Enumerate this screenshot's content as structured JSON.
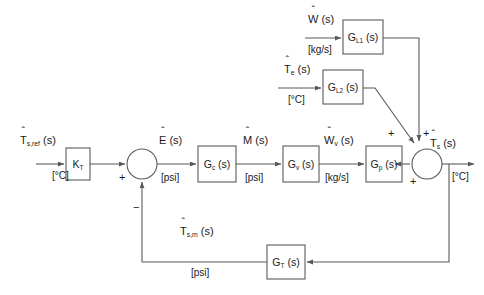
{
  "diagram": {
    "type": "block-diagram",
    "stroke_color": "#595959",
    "text_color": "#1a1a1a"
  },
  "signals": {
    "reference": {
      "name": "T",
      "sub": "s,ref",
      "arg": "(s)",
      "unit": "[°C]"
    },
    "error": {
      "name": "E",
      "sub": "",
      "arg": "(s)",
      "unit": "[psi]"
    },
    "controller_out": {
      "name": "M",
      "sub": "",
      "arg": "(s)",
      "unit": "[psi]"
    },
    "valve_out": {
      "name": "W",
      "sub": "v",
      "arg": "(s)",
      "unit": "[kg/s]"
    },
    "output": {
      "name": "T",
      "sub": "s",
      "arg": "(s)",
      "unit": "[°C]"
    },
    "measured": {
      "name": "T",
      "sub": "s,m",
      "arg": "(s)",
      "unit": "[psi]"
    },
    "disturbance_flow": {
      "name": "W",
      "sub": "",
      "arg": "(s)",
      "unit": "[kg/s]"
    },
    "disturbance_temp": {
      "name": "T",
      "sub": "e",
      "arg": "(s)",
      "unit": "[°C]"
    },
    "transmitter_unit": "[psi]"
  },
  "blocks": [
    {
      "id": "kt",
      "name": "K",
      "sub": "T",
      "arg": "",
      "label": "K_T"
    },
    {
      "id": "gc",
      "name": "G",
      "sub": "c",
      "arg": " (s)",
      "label": "G_c (s)"
    },
    {
      "id": "gv",
      "name": "G",
      "sub": "v",
      "arg": " (s)",
      "label": "G_v (s)"
    },
    {
      "id": "gp",
      "name": "G",
      "sub": "p",
      "arg": " (s)",
      "label": "G_p (s)"
    },
    {
      "id": "gl1",
      "name": "G",
      "sub": "L1",
      "arg": " (s)",
      "label": "G_L1 (s)"
    },
    {
      "id": "gl2",
      "name": "G",
      "sub": "L2",
      "arg": " (s)",
      "label": "G_L2 (s)"
    },
    {
      "id": "gt",
      "name": "G",
      "sub": "T",
      "arg": " (s)",
      "label": "G_T (s)"
    }
  ],
  "summing_junctions": {
    "error_junction": {
      "input_sign": "+",
      "feedback_sign": "−"
    },
    "output_junction": {
      "plant_sign": "+",
      "load1_sign": "+",
      "load2_sign": "+"
    }
  }
}
